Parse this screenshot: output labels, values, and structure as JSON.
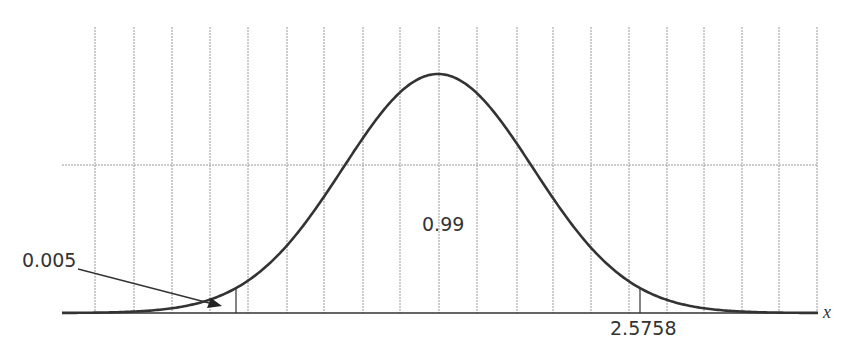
{
  "figure": {
    "annotations": {
      "left_tail_area": "0.005",
      "center_area": "0.99",
      "right_critical_value": "2.5758",
      "axis_variable": "x"
    },
    "colors": {
      "curve": "#333333",
      "grid": "#9a9a9a",
      "axis": "#333333",
      "text": "#333333",
      "background": "#ffffff"
    }
  },
  "chart_data": {
    "type": "line",
    "title": "",
    "xlabel": "x",
    "ylabel": "",
    "distribution": "normal(0,1)",
    "central_area": 0.99,
    "tail_area_each": 0.005,
    "critical_values": [
      -2.5758,
      2.5758
    ],
    "labeled_values": [
      "0.005",
      "0.99",
      "2.5758"
    ],
    "grid": {
      "vertical_lines": 20,
      "horizontal_lines": 1
    },
    "layout": {
      "x_center_px": 438,
      "baseline_px": 313,
      "peak_px": 74,
      "sigma_px": 95,
      "left_boundary_px": 236,
      "right_boundary_px": 640,
      "grid_x_px": [
        95,
        134,
        172,
        210,
        248,
        287,
        324,
        363,
        400,
        439,
        477,
        517,
        553,
        591,
        629,
        667,
        704,
        742,
        779,
        817
      ],
      "grid_y_px": [
        165
      ],
      "grid_top_px": 27,
      "axis_left_px": 62,
      "axis_right_px": 818
    }
  }
}
